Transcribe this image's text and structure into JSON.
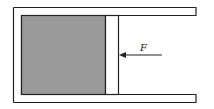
{
  "diagram": {
    "title": "",
    "labels": {
      "force": "F"
    },
    "elements": {
      "cylinder": "closed-left cylinder with open right end",
      "gas": "shaded gas region",
      "piston": "movable piston",
      "force_arrow": "arrow pointing left onto piston"
    },
    "colors": {
      "gas_fill": "#9a9a9a",
      "stroke": "#222222",
      "background": "#ffffff"
    }
  }
}
